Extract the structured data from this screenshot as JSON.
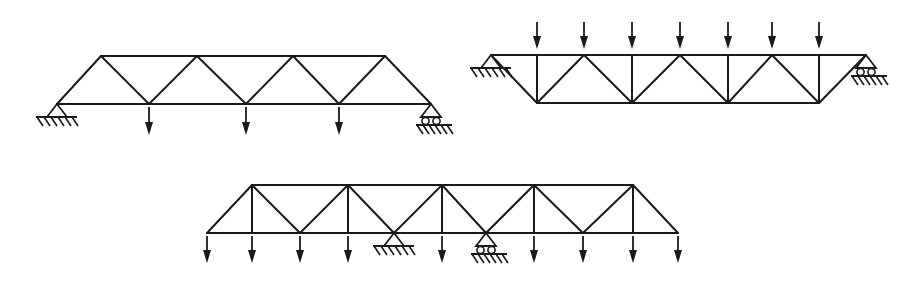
{
  "figure": {
    "width": 921,
    "height": 282,
    "line_color": "#1a1a1a",
    "background": "#ffffff"
  },
  "trusses": [
    {
      "name": "truss-a",
      "description": "Warren truss, 4-panel top chord, simply supported (pin left, roller right), 3 bottom-chord point loads",
      "members": [
        [
          101,
          56,
          385,
          56
        ],
        [
          57,
          104,
          431,
          104
        ],
        [
          57,
          104,
          101,
          56
        ],
        [
          101,
          56,
          149,
          104
        ],
        [
          149,
          104,
          197,
          56
        ],
        [
          197,
          56,
          246,
          104
        ],
        [
          246,
          104,
          293,
          56
        ],
        [
          293,
          56,
          339,
          104
        ],
        [
          339,
          104,
          385,
          56
        ],
        [
          385,
          56,
          431,
          104
        ]
      ],
      "supports": [
        {
          "type": "pin",
          "x": 57,
          "y": 104
        },
        {
          "type": "roller",
          "x": 431,
          "y": 104
        }
      ],
      "loads": [
        {
          "x": 149,
          "y1": 107,
          "y2": 135
        },
        {
          "x": 246,
          "y1": 107,
          "y2": 135
        },
        {
          "x": 339,
          "y1": 107,
          "y2": 135
        }
      ]
    },
    {
      "name": "truss-b",
      "description": "Inverted Warren truss with verticals, supported at top-chord ends (pin left, roller right), 7 top-chord point loads",
      "members": [
        [
          491,
          55,
          866,
          55
        ],
        [
          537,
          103,
          819,
          103
        ],
        [
          491,
          55,
          537,
          103
        ],
        [
          537,
          55,
          537,
          103
        ],
        [
          537,
          103,
          584,
          55
        ],
        [
          584,
          55,
          632,
          103
        ],
        [
          632,
          55,
          632,
          103
        ],
        [
          632,
          103,
          680,
          55
        ],
        [
          680,
          55,
          728,
          103
        ],
        [
          728,
          55,
          728,
          103
        ],
        [
          728,
          103,
          772,
          55
        ],
        [
          772,
          55,
          819,
          103
        ],
        [
          819,
          55,
          819,
          103
        ],
        [
          819,
          103,
          866,
          55
        ]
      ],
      "supports": [
        {
          "type": "pin",
          "x": 491,
          "y": 55
        },
        {
          "type": "roller",
          "x": 866,
          "y": 55
        }
      ],
      "loads": [
        {
          "x": 537,
          "y1": 22,
          "y2": 49
        },
        {
          "x": 584,
          "y1": 22,
          "y2": 49
        },
        {
          "x": 632,
          "y1": 22,
          "y2": 49
        },
        {
          "x": 680,
          "y1": 22,
          "y2": 49
        },
        {
          "x": 728,
          "y1": 22,
          "y2": 49
        },
        {
          "x": 772,
          "y1": 22,
          "y2": 49
        },
        {
          "x": 819,
          "y1": 22,
          "y2": 49
        }
      ]
    },
    {
      "name": "truss-c",
      "description": "Warren truss with verticals and overhanging ends, interior supports (pin and roller), 9 bottom-chord point loads",
      "members": [
        [
          252,
          185,
          633,
          185
        ],
        [
          207,
          233,
          678,
          233
        ],
        [
          207,
          233,
          252,
          185
        ],
        [
          252,
          185,
          252,
          233
        ],
        [
          252,
          185,
          300,
          233
        ],
        [
          300,
          233,
          348,
          185
        ],
        [
          348,
          185,
          348,
          233
        ],
        [
          348,
          185,
          394,
          233
        ],
        [
          394,
          233,
          442,
          185
        ],
        [
          442,
          185,
          442,
          233
        ],
        [
          442,
          185,
          486,
          233
        ],
        [
          486,
          233,
          534,
          185
        ],
        [
          534,
          185,
          534,
          233
        ],
        [
          534,
          185,
          583,
          233
        ],
        [
          583,
          233,
          633,
          185
        ],
        [
          633,
          185,
          633,
          233
        ],
        [
          633,
          185,
          678,
          233
        ]
      ],
      "supports": [
        {
          "type": "pin",
          "x": 394,
          "y": 233
        },
        {
          "type": "roller",
          "x": 486,
          "y": 233
        }
      ],
      "loads": [
        {
          "x": 207,
          "y1": 236,
          "y2": 263
        },
        {
          "x": 252,
          "y1": 236,
          "y2": 263
        },
        {
          "x": 300,
          "y1": 236,
          "y2": 263
        },
        {
          "x": 348,
          "y1": 236,
          "y2": 263
        },
        {
          "x": 442,
          "y1": 236,
          "y2": 263
        },
        {
          "x": 534,
          "y1": 236,
          "y2": 263
        },
        {
          "x": 583,
          "y1": 236,
          "y2": 263
        },
        {
          "x": 633,
          "y1": 236,
          "y2": 263
        },
        {
          "x": 678,
          "y1": 236,
          "y2": 263
        }
      ]
    }
  ]
}
